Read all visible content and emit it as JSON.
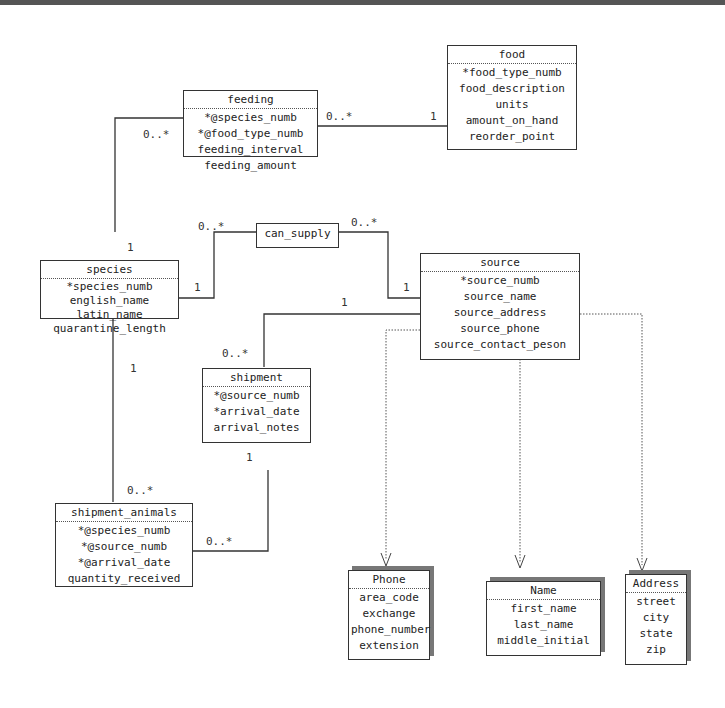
{
  "classes": {
    "feeding": {
      "name": "feeding",
      "attrs": [
        "*@species_numb",
        "*@food_type_numb",
        "feeding_interval",
        "feeding_amount"
      ]
    },
    "food": {
      "name": "food",
      "attrs": [
        "*food_type_numb",
        "food_description",
        "units",
        "amount_on_hand",
        "reorder_point"
      ]
    },
    "can_supply": {
      "name": "can_supply"
    },
    "species": {
      "name": "species",
      "attrs": [
        "*species_numb",
        "english_name",
        "latin_name",
        "quarantine_length"
      ]
    },
    "source": {
      "name": "source",
      "attrs": [
        "*source_numb",
        "source_name",
        "source_address",
        "source_phone",
        "source_contact_peson"
      ]
    },
    "shipment": {
      "name": "shipment",
      "attrs": [
        "*@source_numb",
        "*arrival_date",
        "arrival_notes"
      ]
    },
    "shipment_animals": {
      "name": "shipment_animals",
      "attrs": [
        "*@species_numb",
        "*@source_numb",
        "*@arrival_date",
        "quantity_received"
      ]
    },
    "phone": {
      "name": "Phone",
      "attrs": [
        "area_code",
        "exchange",
        "phone_number",
        "extension"
      ]
    },
    "name": {
      "name": "Name",
      "attrs": [
        "first_name",
        "last_name",
        "middle_initial"
      ]
    },
    "address": {
      "name": "Address",
      "attrs": [
        "street",
        "city",
        "state",
        "zip"
      ]
    }
  },
  "multiplicities": {
    "feeding_species": "0..*",
    "species_feeding": "1",
    "feeding_food": "0..*",
    "food_feeding": "1",
    "cansupply_species_side": "0..*",
    "species_cansupply": "1",
    "cansupply_source_side": "0..*",
    "source_cansupply": "1",
    "source_shipment": "1",
    "shipment_source": "0..*",
    "species_shipanimals": "1",
    "shipanimals_species": "0..*",
    "shipment_shipanimals": "1",
    "shipanimals_shipment": "0..*"
  }
}
